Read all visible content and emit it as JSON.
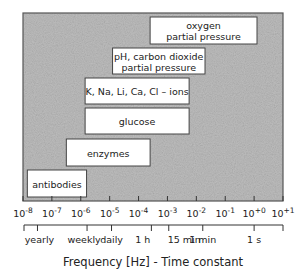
{
  "chart_data": {
    "type": "range-bar",
    "title": "",
    "xlabel": "Frequency [Hz] - Time constant",
    "xscale": "log10",
    "xlim_exponent": [
      -8,
      1
    ],
    "grid": false,
    "background": "#bdbdbd",
    "x_ticks": [
      {
        "exp": -8,
        "base": "10",
        "sup": "-8"
      },
      {
        "exp": -7,
        "base": "10",
        "sup": "-7"
      },
      {
        "exp": -6,
        "base": "10",
        "sup": "-6"
      },
      {
        "exp": -5,
        "base": "10",
        "sup": "-5"
      },
      {
        "exp": -4,
        "base": "10",
        "sup": "-4"
      },
      {
        "exp": -3,
        "base": "10",
        "sup": "-3"
      },
      {
        "exp": -2,
        "base": "10",
        "sup": "-2"
      },
      {
        "exp": -1,
        "base": "10",
        "sup": "-1"
      },
      {
        "exp": 0,
        "base": "10",
        "sup": "+0"
      },
      {
        "exp": 1,
        "base": "10",
        "sup": "+1"
      }
    ],
    "time_marks": [
      {
        "label": "yearly",
        "freq_hz": 3.17e-08
      },
      {
        "label": "weekly",
        "freq_hz": 1.65e-06
      },
      {
        "label": "daily",
        "freq_hz": 1.16e-05
      },
      {
        "label": "1 h",
        "freq_hz": 0.000278
      },
      {
        "label": "15 min",
        "freq_hz": 0.00111
      },
      {
        "label": "1 min",
        "freq_hz": 0.0167
      },
      {
        "label": "1 s",
        "freq_hz": 1.0
      }
    ],
    "bars": [
      {
        "label": [
          "oxygen",
          "partial pressure"
        ],
        "from_exp": -3.6,
        "to_exp": 0.1
      },
      {
        "label": [
          "pH, carbon dioxide",
          "partial pressure"
        ],
        "from_exp": -4.9,
        "to_exp": -1.7
      },
      {
        "label": [
          "K, Na, Li, Ca, Cl – ions"
        ],
        "from_exp": -5.85,
        "to_exp": -2.25
      },
      {
        "label": [
          "glucose"
        ],
        "from_exp": -5.85,
        "to_exp": -2.25
      },
      {
        "label": [
          "enzymes"
        ],
        "from_exp": -6.5,
        "to_exp": -3.6
      },
      {
        "label": [
          "antibodies"
        ],
        "from_exp": -7.85,
        "to_exp": -5.8
      }
    ]
  }
}
